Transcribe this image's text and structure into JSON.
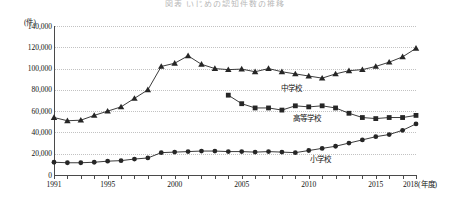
{
  "title": "図表 いじめの認知件数の推移",
  "axes": {
    "y_unit": "(件)",
    "x_unit": "(年度)",
    "y_ticks": [
      "0",
      "20,000",
      "40,000",
      "60,000",
      "80,000",
      "100,000",
      "120,000",
      "140,000"
    ],
    "x_ticks": [
      "1991",
      "1995",
      "2000",
      "2005",
      "2010",
      "2015",
      "2018"
    ],
    "ylim": [
      0,
      140000
    ],
    "xlim": [
      1991,
      2018
    ]
  },
  "series_labels": {
    "junior_high": "中学校",
    "high_school": "高等学校",
    "elementary": "小学校"
  },
  "chart_data": {
    "type": "line",
    "title": "図表 いじめの認知件数の推移",
    "xlabel": "(年度)",
    "ylabel": "(件)",
    "ylim": [
      0,
      140000
    ],
    "grid": true,
    "legend": "inline-annotations",
    "x": [
      1991,
      1992,
      1993,
      1994,
      1995,
      1996,
      1997,
      1998,
      1999,
      2000,
      2001,
      2002,
      2003,
      2004,
      2005,
      2006,
      2007,
      2008,
      2009,
      2010,
      2011,
      2012,
      2013,
      2014,
      2015,
      2016,
      2017,
      2018
    ],
    "series": [
      {
        "name": "中学校",
        "marker": "triangle",
        "values": [
          54000,
          51000,
          51500,
          56000,
          60000,
          64000,
          72000,
          80000,
          102000,
          105000,
          112000,
          104000,
          100000,
          99000,
          99500,
          97000,
          100000,
          97000,
          95000,
          93000,
          91000,
          95000,
          98000,
          99000,
          102000,
          106000,
          111000,
          119000
        ]
      },
      {
        "name": "高等学校",
        "marker": "square",
        "values": [
          null,
          null,
          null,
          null,
          null,
          null,
          null,
          null,
          null,
          null,
          null,
          null,
          null,
          75000,
          67000,
          63000,
          63000,
          61000,
          65000,
          64000,
          65000,
          63000,
          58000,
          54000,
          53000,
          54000,
          54000,
          56000
        ]
      },
      {
        "name": "小学校",
        "marker": "circle",
        "values": [
          12000,
          11500,
          11500,
          12000,
          13000,
          13500,
          15000,
          16000,
          21000,
          21500,
          22000,
          22500,
          22500,
          22000,
          22000,
          21500,
          22000,
          21500,
          21000,
          23000,
          25000,
          27000,
          30000,
          33000,
          36000,
          38000,
          42000,
          48000
        ]
      }
    ]
  }
}
